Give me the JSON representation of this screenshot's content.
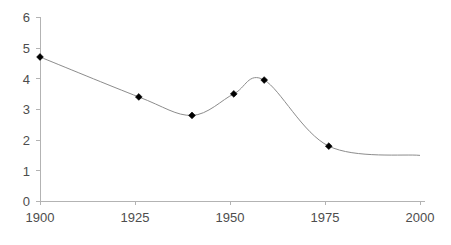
{
  "chart_data": {
    "type": "line",
    "title": "",
    "subtitle": "",
    "xlabel": "",
    "ylabel": "",
    "xlim": [
      1900,
      2000
    ],
    "ylim": [
      0,
      6
    ],
    "grid": false,
    "legend": false,
    "legend_position": "none",
    "x_ticks": [
      1900,
      1925,
      1950,
      1975,
      2000
    ],
    "y_ticks": [
      0,
      1,
      2,
      3,
      4,
      5,
      6
    ],
    "x_tick_labels": [
      "1900",
      "1925",
      "1950",
      "1975",
      "2000"
    ],
    "y_tick_labels": [
      "0",
      "1",
      "2",
      "3",
      "4",
      "5",
      "6"
    ],
    "marker_style": "diamond",
    "line_color": "#8c8c8c",
    "marker_color": "#000000",
    "axis_color": "#b3b3b3",
    "tick_label_color": "#4d4d4d",
    "series": [
      {
        "name": "series-1",
        "points": [
          {
            "x": 1900,
            "y": 4.7
          },
          {
            "x": 1926,
            "y": 3.4
          },
          {
            "x": 1940,
            "y": 2.8
          },
          {
            "x": 1951,
            "y": 3.5
          },
          {
            "x": 1959,
            "y": 3.95
          },
          {
            "x": 1976,
            "y": 1.8
          }
        ],
        "x": [
          1900,
          1926,
          1940,
          1951,
          1959,
          1976
        ],
        "values": [
          4.7,
          3.4,
          2.8,
          3.5,
          3.95,
          1.8
        ],
        "tail_extends_to_x": 2000,
        "tail_end_y": 1.5,
        "interpolation": "smooth-spline"
      }
    ],
    "annotations": []
  },
  "axes": {
    "y_axis_name": "value-axis",
    "x_axis_name": "year-axis"
  }
}
